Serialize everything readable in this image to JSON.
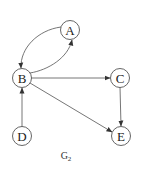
{
  "graph": {
    "caption": "G",
    "caption_subscript": "2",
    "nodes": [
      {
        "id": "A",
        "label": "A",
        "x": 70,
        "y": 30
      },
      {
        "id": "B",
        "label": "B",
        "x": 22,
        "y": 78
      },
      {
        "id": "C",
        "label": "C",
        "x": 120,
        "y": 78
      },
      {
        "id": "D",
        "label": "D",
        "x": 22,
        "y": 136
      },
      {
        "id": "E",
        "label": "E",
        "x": 121,
        "y": 136
      }
    ],
    "edges": [
      {
        "from": "A",
        "to": "B",
        "curved": true
      },
      {
        "from": "B",
        "to": "A",
        "curved": true
      },
      {
        "from": "B",
        "to": "C"
      },
      {
        "from": "B",
        "to": "E"
      },
      {
        "from": "C",
        "to": "E"
      },
      {
        "from": "D",
        "to": "B"
      }
    ]
  }
}
